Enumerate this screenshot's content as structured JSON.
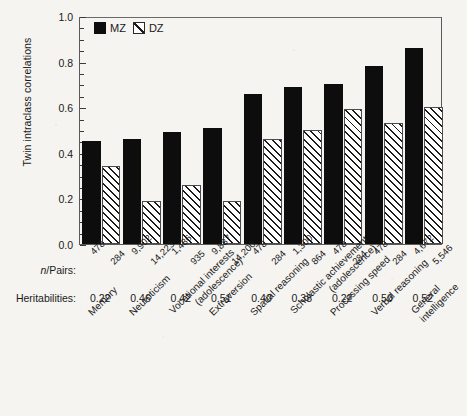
{
  "chart_data": {
    "type": "bar",
    "title": "",
    "xlabel": "",
    "ylabel": "Twin intraclass correlations",
    "ylim": [
      0.0,
      1.0
    ],
    "ytick_labels": [
      "0.0",
      "0.2",
      "0.4",
      "0.6",
      "0.8",
      "1.0"
    ],
    "ytick_values": [
      0.0,
      0.2,
      0.4,
      0.6,
      0.8,
      1.0
    ],
    "minor_tick_step": 0.05,
    "grid": false,
    "legend_position": "top-left",
    "categories": [
      "Memory",
      "Neuroticism",
      "Vocational interests (adolescence)",
      "Extraversion",
      "Spatial reasoning",
      "Scholastic achievement (adolescence)",
      "Processing speed",
      "Verbal reasoning",
      "General intelligence"
    ],
    "category_lines": [
      [
        "Memory"
      ],
      [
        "Neuroticism"
      ],
      [
        "Vocational interests",
        "(adolescence)"
      ],
      [
        "Extraversion"
      ],
      [
        "Spatial reasoning"
      ],
      [
        "Scholastic achievement",
        "(adolescence)"
      ],
      [
        "Processing speed"
      ],
      [
        "Verbal reasoning"
      ],
      [
        "General",
        "intelligence"
      ]
    ],
    "series": [
      {
        "name": "MZ",
        "values": [
          0.45,
          0.46,
          0.49,
          0.51,
          0.66,
          0.69,
          0.7,
          0.78,
          0.86
        ]
      },
      {
        "name": "DZ",
        "values": [
          0.34,
          0.19,
          0.26,
          0.19,
          0.46,
          0.5,
          0.59,
          0.53,
          0.6
        ]
      }
    ],
    "annotations": {
      "npairs_label": "n/Pairs:",
      "npairs_label_italic_prefix": "n",
      "npairs_label_rest": "/Pairs:",
      "npairs_mz": [
        "478",
        "9,902",
        "1,486",
        "9,887",
        "478",
        "1,300",
        "478",
        "478",
        "4,672"
      ],
      "npairs_dz": [
        "284",
        "14,223",
        "935",
        "14,200",
        "284",
        "864",
        "284",
        "284",
        "5,546"
      ],
      "heritabilities_label": "Heritabilities:",
      "heritabilities": [
        "0.22",
        "0.46",
        "0.42",
        "0.51",
        "0.40",
        "0.38",
        "0.22",
        "0.50",
        "0.52"
      ]
    }
  },
  "legend": {
    "items": [
      {
        "key": "MZ",
        "label": "MZ",
        "style": "solid-black"
      },
      {
        "key": "DZ",
        "label": "DZ",
        "style": "hatched"
      }
    ]
  },
  "colors": {
    "mz_fill": "#0d0d0d",
    "dz_hatch": "#1a1a1a",
    "dz_background": "#ffffff",
    "axis": "#5a5a5a",
    "text": "#1a1a1a",
    "page_background": "#f5f4f1"
  }
}
